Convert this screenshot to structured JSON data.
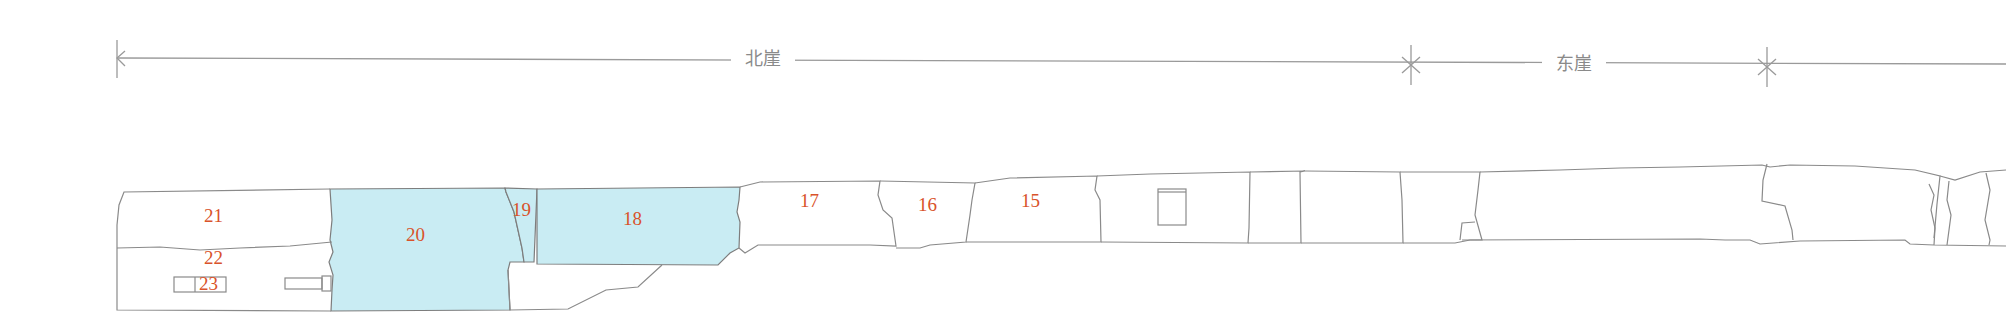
{
  "dimension_line": {
    "stroke": "#9a9a9a",
    "segments": [
      {
        "label": "北崖",
        "from_x": 117,
        "to_x": 1411,
        "label_x": 745
      },
      {
        "label": "东崖",
        "from_x": 1411,
        "to_x": 1767,
        "label_x": 1556
      },
      {
        "label": "",
        "from_x": 1767,
        "to_x": 2006
      }
    ]
  },
  "diagram": {
    "highlight_fill": "#c9ecf3",
    "outline_stroke": "#7d7d7d",
    "label_color": "#d9532b",
    "regions": [
      {
        "id": "21",
        "label": "21",
        "highlighted": false
      },
      {
        "id": "22",
        "label": "22",
        "highlighted": false
      },
      {
        "id": "23",
        "label": "23",
        "highlighted": false
      },
      {
        "id": "20",
        "label": "20",
        "highlighted": true
      },
      {
        "id": "19",
        "label": "19",
        "highlighted": true
      },
      {
        "id": "18",
        "label": "18",
        "highlighted": true
      },
      {
        "id": "17",
        "label": "17",
        "highlighted": false
      },
      {
        "id": "16",
        "label": "16",
        "highlighted": false
      },
      {
        "id": "15",
        "label": "15",
        "highlighted": false
      }
    ]
  }
}
